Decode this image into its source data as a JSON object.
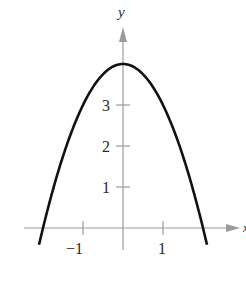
{
  "chart_data": {
    "type": "line",
    "title": "",
    "xlabel": "x",
    "ylabel": "y",
    "function": "y = 4 - x^2",
    "xlim": [
      -2.1,
      2.9
    ],
    "ylim": [
      -0.6,
      5.0
    ],
    "x_ticks": [
      {
        "value": -1,
        "label": "−1"
      },
      {
        "value": 1,
        "label": "1"
      }
    ],
    "y_ticks": [
      {
        "value": 1,
        "label": "1"
      },
      {
        "value": 2,
        "label": "2"
      },
      {
        "value": 3,
        "label": "3"
      }
    ],
    "grid": false,
    "legend": null,
    "series": [
      {
        "name": "y = 4 - x^2",
        "x": [
          -2.1,
          -2.0,
          -1.5,
          -1.0,
          -0.5,
          0.0,
          0.5,
          1.0,
          1.5,
          2.0,
          2.1
        ],
        "y": [
          -0.41,
          0.0,
          1.75,
          3.0,
          3.75,
          4.0,
          3.75,
          3.0,
          1.75,
          0.0,
          -0.41
        ]
      }
    ],
    "colors": {
      "curve": "#111111",
      "axis": "#9a9a9a",
      "text": "#2a2a2a"
    }
  }
}
